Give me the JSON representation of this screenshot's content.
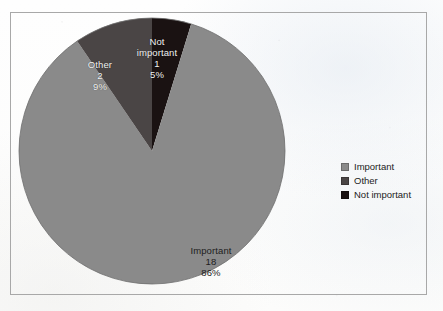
{
  "figure": {
    "frame_visible": true,
    "background_color": "#fdfdfd",
    "frame_color": "#a8a8a8"
  },
  "chart_data": {
    "type": "pie",
    "title": "",
    "xlabel": "",
    "ylabel": "",
    "legend_position": "right",
    "grid": false,
    "total": 21,
    "categories": [
      "Important",
      "Other",
      "Not important"
    ],
    "values": [
      18,
      2,
      1
    ],
    "percentages": [
      "86%",
      "9%",
      "5%"
    ],
    "colors": [
      "#8a8a8a",
      "#4a4545",
      "#1a1212"
    ],
    "start_angle_deg": 0,
    "direction": "clockwise",
    "slices": [
      {
        "name": "Important",
        "value": 18,
        "percent": "86%",
        "color": "#8a8a8a",
        "label_lines": [
          "Important",
          "18",
          "86%"
        ]
      },
      {
        "name": "Other",
        "value": 2,
        "percent": "9%",
        "color": "#4a4545",
        "label_lines": [
          "Other",
          "2",
          "9%"
        ]
      },
      {
        "name": "Not important",
        "value": 1,
        "percent": "5%",
        "color": "#1a1212",
        "label_lines": [
          "Not",
          "important",
          "1",
          "5%"
        ]
      }
    ]
  },
  "legend": {
    "items": [
      {
        "label": "Important",
        "color": "#8a8a8a"
      },
      {
        "label": "Other",
        "color": "#4a4545"
      },
      {
        "label": "Not important",
        "color": "#1a1212"
      }
    ]
  }
}
